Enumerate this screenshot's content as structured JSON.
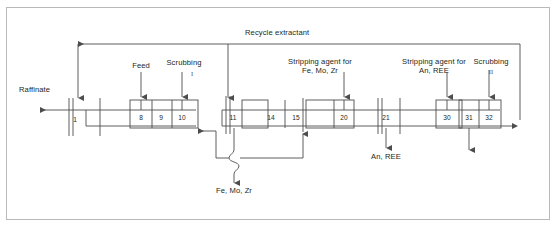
{
  "figure": {
    "type": "process-flow-diagram",
    "width": 557,
    "height": 228,
    "border_color": "#b9b9b9",
    "line_color": "#4d4d4d",
    "text_color": "#231f20",
    "background": "#ffffff"
  },
  "labels": {
    "recycle_extractant": "Recycle extractant",
    "raffinate": "Raffinate",
    "feed": "Feed",
    "scrubbing_1": "Scrubbing",
    "scrubbing_1_numeral": "I",
    "scrubbing_2": "Scrubbing",
    "scrubbing_2_numeral": "II",
    "stripping_fe_mo_zr_line1": "Stripping agent for",
    "stripping_fe_mo_zr_line2": "Fe, Mo, Zr",
    "stripping_an_ree_line1": "Stripping agent for",
    "stripping_an_ree_line2": "An, REE",
    "product_fe_mo_zr": "Fe, Mo, Zr",
    "product_an_ree": "An, REE"
  },
  "stages": [
    {
      "number": "1",
      "x": 75,
      "y": 120,
      "section": "extraction"
    },
    {
      "number": "8",
      "x": 141,
      "y": 118,
      "section": "extraction"
    },
    {
      "number": "9",
      "x": 161,
      "y": 118,
      "section": "extraction"
    },
    {
      "number": "10",
      "x": 182,
      "y": 118,
      "section": "extraction"
    },
    {
      "number": "11",
      "x": 233,
      "y": 118,
      "section": "scrubbing-1"
    },
    {
      "number": "14",
      "x": 271,
      "y": 118,
      "section": "scrubbing-1"
    },
    {
      "number": "15",
      "x": 296,
      "y": 118,
      "section": "scrubbing-1"
    },
    {
      "number": "20",
      "x": 344,
      "y": 118,
      "section": "stripping-1"
    },
    {
      "number": "21",
      "x": 386,
      "y": 118,
      "section": "stripping-1"
    },
    {
      "number": "30",
      "x": 447,
      "y": 118,
      "section": "stripping-2"
    },
    {
      "number": "31",
      "x": 469,
      "y": 118,
      "section": "stripping-2"
    },
    {
      "number": "32",
      "x": 489,
      "y": 118,
      "section": "scrubbing-2"
    }
  ],
  "streams": {
    "inputs": [
      {
        "name": "feed",
        "label": "Feed",
        "target_stage": "8"
      },
      {
        "name": "scrubbing-1",
        "label": "Scrubbing",
        "target_stage": "10"
      },
      {
        "name": "stripping-agent-fe-mo-zr",
        "label": "Stripping agent for Fe, Mo, Zr",
        "target_stage": "20"
      },
      {
        "name": "stripping-agent-an-ree",
        "label": "Stripping agent for An, REE",
        "target_stage": "30"
      },
      {
        "name": "scrubbing-2",
        "label": "Scrubbing",
        "target_stage": "32"
      }
    ],
    "outputs": [
      {
        "name": "raffinate",
        "label": "Raffinate",
        "direction": "left"
      },
      {
        "name": "fe-mo-zr",
        "label": "Fe, Mo, Zr",
        "direction": "down"
      },
      {
        "name": "an-ree",
        "label": "An, REE",
        "direction": "down"
      }
    ],
    "recycle": {
      "name": "recycle-extractant",
      "label": "Recycle extractant",
      "direction": "left"
    }
  }
}
